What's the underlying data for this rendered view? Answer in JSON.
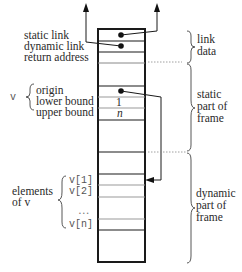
{
  "diagram": {
    "title": "",
    "left_labels": {
      "static_link": "static link",
      "dynamic_link": "dynamic link",
      "return_address": "return address",
      "v_name": "v",
      "origin": "origin",
      "lower_bound": "lower bound",
      "upper_bound": "upper bound",
      "elements_line1": "elements",
      "elements_line2": "of v",
      "v1": "v[1]",
      "v2": "v[2]",
      "ellipsis": "…",
      "vn": "v[n]"
    },
    "cell_values": {
      "lower_bound_value": "1",
      "upper_bound_value": "n"
    },
    "right_labels": {
      "link_data_1": "link",
      "link_data_2": "data",
      "static_part_1": "static",
      "static_part_2": "part of",
      "static_part_3": "frame",
      "dynamic_part_1": "dynamic",
      "dynamic_part_2": "part of",
      "dynamic_part_3": "frame"
    },
    "colors": {
      "stroke": "#1a1a1a",
      "thin_line": "#9a9a9a",
      "text": "#2a2a2a"
    }
  }
}
